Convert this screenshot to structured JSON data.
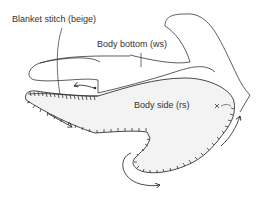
{
  "diagram": {
    "labels": {
      "blanket_stitch": "Blanket stitch (beige)",
      "body_bottom": "Body bottom (ws)",
      "body_side": "Body side (rs)",
      "marker": "×"
    },
    "colors": {
      "line": "#333333",
      "fill": "#f3f3f3",
      "background": "#ffffff"
    },
    "annotations": [
      {
        "type": "leader-line",
        "from": "blanket_stitch",
        "to": "stitched-edge"
      },
      {
        "type": "leader-line",
        "from": "body_bottom",
        "to": "body-bottom-outline"
      },
      {
        "type": "arrow",
        "name": "direction-arrow-left",
        "direction": "left"
      },
      {
        "type": "arrow",
        "name": "direction-arrow-lower-left",
        "direction": "down-right"
      },
      {
        "type": "arrow",
        "name": "direction-arrow-bottom",
        "direction": "curved-right"
      },
      {
        "type": "arrow",
        "name": "direction-arrow-right",
        "direction": "up"
      },
      {
        "type": "marker",
        "name": "start-marker",
        "glyph": "x"
      }
    ]
  }
}
